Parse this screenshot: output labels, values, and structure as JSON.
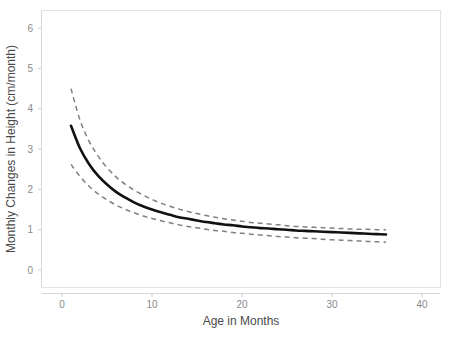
{
  "chart_data": {
    "type": "line",
    "title": "",
    "subtitle": "",
    "xlabel": "Age in Months",
    "ylabel": "Monthly Changes in Height (cm/month)",
    "xlim": [
      -2,
      43
    ],
    "ylim": [
      -0.4,
      6.6
    ],
    "xticks": [
      0,
      10,
      20,
      30,
      40
    ],
    "xtick_labels": [
      "0",
      "10",
      "20",
      "30",
      "40"
    ],
    "yticks": [
      0,
      1,
      2,
      3,
      4,
      5,
      6
    ],
    "ytick_labels": [
      "0",
      "1",
      "2",
      "3",
      "4",
      "5",
      "6"
    ],
    "grid": false,
    "legend": "none",
    "annotations": [],
    "colors": {
      "fit": "#111111",
      "confidence_interval": "#808080",
      "panel_background": "#ffffff",
      "panel_border": "#e2e2e2",
      "tick_label": "#8a8a8a",
      "axis_title": "#4a4a4a"
    },
    "x": [
      1,
      2,
      3,
      4,
      5,
      6,
      7,
      8,
      9,
      10,
      11,
      12,
      13,
      14,
      15,
      16,
      17,
      18,
      19,
      20,
      21,
      22,
      23,
      24,
      25,
      26,
      27,
      28,
      29,
      30,
      31,
      32,
      33,
      34,
      35,
      36
    ],
    "series": [
      {
        "name": "Upper 95% confidence limit",
        "style": "dashed",
        "color": "#808080",
        "values": [
          4.5,
          3.72,
          3.2,
          2.83,
          2.54,
          2.31,
          2.13,
          1.98,
          1.86,
          1.75,
          1.66,
          1.58,
          1.51,
          1.45,
          1.4,
          1.35,
          1.31,
          1.27,
          1.24,
          1.21,
          1.18,
          1.16,
          1.14,
          1.12,
          1.1,
          1.08,
          1.07,
          1.06,
          1.05,
          1.04,
          1.03,
          1.02,
          1.01,
          1.01,
          1.0,
          1.0
        ]
      },
      {
        "name": "Fitted monthly height change",
        "style": "solid",
        "color": "#111111",
        "values": [
          3.58,
          3.02,
          2.63,
          2.34,
          2.12,
          1.94,
          1.8,
          1.68,
          1.58,
          1.5,
          1.43,
          1.37,
          1.31,
          1.27,
          1.23,
          1.19,
          1.16,
          1.13,
          1.11,
          1.08,
          1.06,
          1.04,
          1.03,
          1.01,
          1.0,
          0.98,
          0.97,
          0.96,
          0.95,
          0.94,
          0.93,
          0.92,
          0.91,
          0.9,
          0.89,
          0.88
        ]
      },
      {
        "name": "Lower 95% confidence limit",
        "style": "dashed",
        "color": "#808080",
        "values": [
          2.62,
          2.32,
          2.08,
          1.89,
          1.74,
          1.61,
          1.51,
          1.42,
          1.34,
          1.28,
          1.22,
          1.17,
          1.12,
          1.08,
          1.05,
          1.01,
          0.98,
          0.96,
          0.93,
          0.91,
          0.89,
          0.87,
          0.85,
          0.83,
          0.82,
          0.8,
          0.79,
          0.78,
          0.76,
          0.75,
          0.74,
          0.73,
          0.72,
          0.71,
          0.7,
          0.69
        ]
      }
    ]
  }
}
